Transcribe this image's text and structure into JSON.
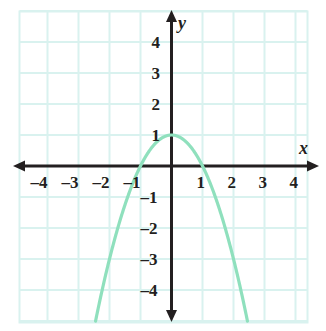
{
  "figure": {
    "background_color": "#ffffff",
    "grid_color": "#d9f2ef",
    "axis_color": "#231f20",
    "curve_color": "#8fe0bd"
  },
  "axes": {
    "x_name": "x",
    "y_name": "y",
    "x_ticks": [
      "–4",
      "–3",
      "–2",
      "–1",
      "1",
      "2",
      "3",
      "4"
    ],
    "y_ticks": [
      "4",
      "3",
      "2",
      "1",
      "–1",
      "–2",
      "–3",
      "–4"
    ]
  },
  "chart_data": {
    "type": "line",
    "title": "",
    "xlabel": "x",
    "ylabel": "y",
    "xlim": [
      -4.9,
      4.9
    ],
    "ylim": [
      -4.9,
      4.9
    ],
    "xticks": [
      -4,
      -3,
      -2,
      -1,
      1,
      2,
      3,
      4
    ],
    "yticks": [
      4,
      3,
      2,
      1,
      -1,
      -2,
      -3,
      -4
    ],
    "xtick_labels": [
      "–4",
      "–3",
      "–2",
      "–1",
      "1",
      "2",
      "3",
      "4"
    ],
    "ytick_labels": [
      "4",
      "3",
      "2",
      "1",
      "–1",
      "–2",
      "–3",
      "–4"
    ],
    "grid": true,
    "grid_spacing": 1,
    "legend": "none",
    "series": [
      {
        "name": "parabola",
        "equation": "y = 1 - x^2",
        "color": "#8fe0bd",
        "vertex": [
          0,
          1
        ],
        "roots": [
          -1,
          1
        ],
        "opens": "down",
        "x": [
          -2.25,
          -2.0,
          -1.75,
          -1.5,
          -1.25,
          -1.0,
          -0.75,
          -0.5,
          -0.25,
          0,
          0.25,
          0.5,
          0.75,
          1.0,
          1.25,
          1.5,
          1.75,
          2.0,
          2.25
        ],
        "values": [
          -4.06,
          -3.0,
          -2.06,
          -1.25,
          -0.56,
          0,
          0.44,
          0.75,
          0.94,
          1,
          0.94,
          0.75,
          0.44,
          0,
          -0.56,
          -1.25,
          -2.06,
          -3.0,
          -4.06
        ]
      }
    ]
  }
}
